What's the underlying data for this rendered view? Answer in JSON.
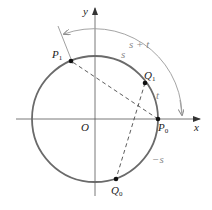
{
  "diagram": {
    "type": "unit-circle-addition-formula",
    "colors": {
      "axes": "#555555",
      "circle": "#6a6a6a",
      "points": "#111111",
      "chords": "#333333",
      "arc_arrows": "#9a9a9a",
      "labels": "#222222",
      "arc_labels": "#888888"
    },
    "axes": {
      "x_label": "x",
      "y_label": "y",
      "origin_label": "O"
    },
    "points": [
      {
        "id": "P0",
        "label": "P",
        "sub": "0"
      },
      {
        "id": "Q1",
        "label": "Q",
        "sub": "1"
      },
      {
        "id": "P1",
        "label": "P",
        "sub": "1"
      },
      {
        "id": "Q0",
        "label": "Q",
        "sub": "0"
      }
    ],
    "arc_labels": {
      "s_plus_t": "s + t",
      "s": "s",
      "t": "t",
      "minus_s": "−s"
    }
  }
}
